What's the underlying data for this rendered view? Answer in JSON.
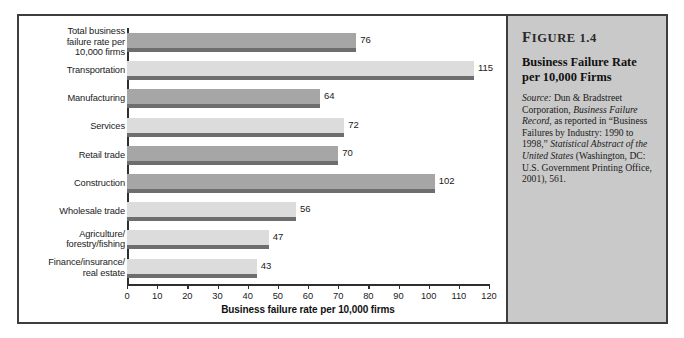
{
  "chart_data": {
    "type": "bar",
    "orientation": "horizontal",
    "title": "Business Failure Rate per 10,000 Firms",
    "xlabel": "Business failure rate per 10,000 firms",
    "ylabel": "",
    "xlim": [
      0,
      120
    ],
    "xticks": [
      0,
      10,
      20,
      30,
      40,
      50,
      60,
      70,
      80,
      90,
      100,
      110,
      120
    ],
    "grid": false,
    "legend": "none",
    "categories": [
      "Total business failure rate per 10,000 firms",
      "Transportation",
      "Manufacturing",
      "Services",
      "Retail trade",
      "Construction",
      "Wholesale trade",
      "Agriculture/ forestry/fishing",
      "Finance/insurance/ real estate"
    ],
    "values": [
      76,
      115,
      64,
      72,
      70,
      102,
      56,
      47,
      43
    ],
    "bar_colors": [
      "dark",
      "light",
      "dark",
      "light",
      "dark",
      "dark",
      "light",
      "light",
      "light"
    ],
    "data_labels": [
      "76",
      "115",
      "64",
      "72",
      "70",
      "102",
      "56",
      "47",
      "43"
    ]
  },
  "chart": {
    "category_labels": [
      [
        "Total business",
        "failure rate per",
        "10,000 firms"
      ],
      [
        "Transportation"
      ],
      [
        "Manufacturing"
      ],
      [
        "Services"
      ],
      [
        "Retail trade"
      ],
      [
        "Construction"
      ],
      [
        "Wholesale trade"
      ],
      [
        "Agriculture/",
        "forestry/fishing"
      ],
      [
        "Finance/insurance/",
        "real estate"
      ]
    ],
    "x_axis_title": "Business failure rate per 10,000 firms"
  },
  "caption": {
    "figure_number_prefix": "F",
    "figure_number_rest": "IGURE",
    "figure_number": "1.4",
    "title_line1": "Business Failure Rate",
    "title_line2": "per 10,000 Firms",
    "source_label": "Source:",
    "source_text_1": " Dun & Bradstreet Corporation, ",
    "source_italic_1": "Business Failure Record",
    "source_text_2": ", as reported in “Business Failures by Industry: 1990 to 1998,” ",
    "source_italic_2": "Statistical Abstract of the United States",
    "source_text_3": " (Washington, DC: U.S. Government Printing Office, 2001), 561."
  },
  "colors": {
    "bar_dark": "#a6a6a6",
    "bar_light": "#dcdcdc",
    "bar_shadow": "#6e6e6e",
    "panel_bg": "#c9c9c9",
    "frame": "#3d3d3d"
  }
}
